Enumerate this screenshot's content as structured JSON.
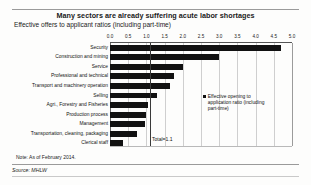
{
  "title": "Many sectors are already suffering acute labor shortages",
  "subtitle": "Effective offers to applicant ratios (including part-time)",
  "note": "Note: As of February 2014.",
  "source": "Source: MHLW",
  "annotation": "Total=1.1",
  "legend": {
    "label": "Effective opening to application ratio (including part-time)",
    "color": "#111111"
  },
  "chart_data": {
    "type": "bar",
    "orientation": "horizontal",
    "title": "Many sectors are already suffering acute labor shortages",
    "subtitle": "Effective offers to applicant ratios (including part-time)",
    "xlabel": "",
    "ylabel": "",
    "xlim": [
      0.0,
      5.0
    ],
    "xticks": [
      "0.0",
      "0.5",
      "1.0",
      "1.5",
      "2.0",
      "2.5",
      "3.0",
      "3.5",
      "4.0",
      "4.5",
      "5.0"
    ],
    "grid": true,
    "legend_position": "inside-right",
    "series_name": "Effective opening to application ratio (including part-time)",
    "categories": [
      "Security",
      "Construction and mining",
      "Service",
      "Professional and technical",
      "Transport and machinery operation",
      "Selling",
      "Agri., Forestry and Fisheries",
      "Production process",
      "Management",
      "Transportation, cleaning, packaging",
      "Clerical staff"
    ],
    "values": [
      4.7,
      3.0,
      2.0,
      1.75,
      1.65,
      1.3,
      1.05,
      1.0,
      0.95,
      0.75,
      0.35
    ],
    "annotations": [
      {
        "text": "Total=1.1",
        "value": 1.1
      }
    ]
  }
}
